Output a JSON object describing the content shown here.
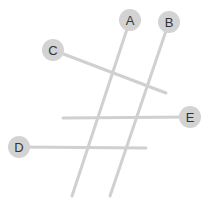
{
  "canvas": {
    "width": 206,
    "height": 202,
    "background_color": "#ffffff"
  },
  "style": {
    "node_fill": "#d3d3d3",
    "line_color": "#d0d0d0",
    "label_color": "#333333",
    "line_width": 3,
    "node_radius": 11,
    "label_font_size": 13
  },
  "diagram": {
    "type": "labeled-line-segments",
    "title": "",
    "nodes": [
      {
        "id": "A",
        "label": "A",
        "cx": 130,
        "cy": 20
      },
      {
        "id": "B",
        "label": "B",
        "cx": 169,
        "cy": 22
      },
      {
        "id": "C",
        "label": "C",
        "cx": 53,
        "cy": 50
      },
      {
        "id": "D",
        "label": "D",
        "cx": 19,
        "cy": 147
      },
      {
        "id": "E",
        "label": "E",
        "cx": 190,
        "cy": 117
      }
    ],
    "lines": [
      {
        "id": "line-A",
        "from_node": "A",
        "x1": 130,
        "y1": 20,
        "x2": 72,
        "y2": 196
      },
      {
        "id": "line-B",
        "from_node": "B",
        "x1": 169,
        "y1": 22,
        "x2": 110,
        "y2": 196
      },
      {
        "id": "line-C",
        "from_node": "C",
        "x1": 53,
        "y1": 50,
        "x2": 166,
        "y2": 93
      },
      {
        "id": "line-D",
        "from_node": "D",
        "x1": 19,
        "y1": 147,
        "x2": 146,
        "y2": 148
      },
      {
        "id": "line-E",
        "from_node": "E",
        "x1": 190,
        "y1": 117,
        "x2": 63,
        "y2": 118
      }
    ]
  }
}
